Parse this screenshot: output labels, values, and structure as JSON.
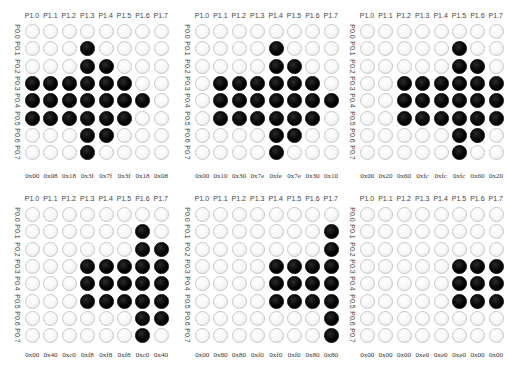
{
  "caption": "",
  "column_labels": [
    "P1.0",
    "P1.1",
    "P1.2",
    "P1.3",
    "P1.4",
    "P1.5",
    "P1.6",
    "P1.7"
  ],
  "row_labels": [
    "P0.0",
    "P0.1",
    "P0.2",
    "P0.3",
    "P0.4",
    "P0.5",
    "P0.6",
    "P0.7"
  ],
  "colors": {
    "led_on": "#000000",
    "led_off": "#f5f5f5",
    "led_border": "#c8c8c8"
  },
  "panels": [
    {
      "id": 1,
      "hex": [
        "0x00",
        "0x08",
        "0x18",
        "0x3f",
        "0x7f",
        "0x3f",
        "0x18",
        "0x08"
      ],
      "grid": [
        [
          0,
          0,
          0,
          0,
          0,
          0,
          0,
          0
        ],
        [
          0,
          0,
          0,
          1,
          0,
          0,
          0,
          0
        ],
        [
          0,
          0,
          0,
          1,
          1,
          0,
          0,
          0
        ],
        [
          1,
          1,
          1,
          1,
          1,
          1,
          0,
          0
        ],
        [
          1,
          1,
          1,
          1,
          1,
          1,
          1,
          0
        ],
        [
          1,
          1,
          1,
          1,
          1,
          1,
          0,
          0
        ],
        [
          0,
          0,
          0,
          1,
          1,
          0,
          0,
          0
        ],
        [
          0,
          0,
          0,
          1,
          0,
          0,
          0,
          0
        ]
      ]
    },
    {
      "id": 2,
      "hex": [
        "0x00",
        "0x10",
        "0x30",
        "0x7e",
        "0xfe",
        "0x7e",
        "0x30",
        "0x10"
      ],
      "grid": [
        [
          0,
          0,
          0,
          0,
          0,
          0,
          0,
          0
        ],
        [
          0,
          0,
          0,
          0,
          1,
          0,
          0,
          0
        ],
        [
          0,
          0,
          0,
          0,
          1,
          1,
          0,
          0
        ],
        [
          0,
          1,
          1,
          1,
          1,
          1,
          1,
          0
        ],
        [
          0,
          1,
          1,
          1,
          1,
          1,
          1,
          1
        ],
        [
          0,
          1,
          1,
          1,
          1,
          1,
          1,
          0
        ],
        [
          0,
          0,
          0,
          0,
          1,
          1,
          0,
          0
        ],
        [
          0,
          0,
          0,
          0,
          1,
          0,
          0,
          0
        ]
      ]
    },
    {
      "id": 3,
      "hex": [
        "0x00",
        "0x20",
        "0x60",
        "0xfc",
        "0xfc",
        "0xfc",
        "0x60",
        "0x20"
      ],
      "grid": [
        [
          0,
          0,
          0,
          0,
          0,
          0,
          0,
          0
        ],
        [
          0,
          0,
          0,
          0,
          0,
          1,
          0,
          0
        ],
        [
          0,
          0,
          0,
          0,
          0,
          1,
          1,
          0
        ],
        [
          0,
          0,
          1,
          1,
          1,
          1,
          1,
          1
        ],
        [
          0,
          0,
          1,
          1,
          1,
          1,
          1,
          1
        ],
        [
          0,
          0,
          1,
          1,
          1,
          1,
          1,
          1
        ],
        [
          0,
          0,
          0,
          0,
          0,
          1,
          1,
          0
        ],
        [
          0,
          0,
          0,
          0,
          0,
          1,
          0,
          0
        ]
      ]
    },
    {
      "id": 4,
      "hex": [
        "0x00",
        "0x40",
        "0xc0",
        "0xf8",
        "0xf8",
        "0xf8",
        "0xc0",
        "0x40"
      ],
      "grid": [
        [
          0,
          0,
          0,
          0,
          0,
          0,
          0,
          0
        ],
        [
          0,
          0,
          0,
          0,
          0,
          0,
          1,
          0
        ],
        [
          0,
          0,
          0,
          0,
          0,
          0,
          1,
          1
        ],
        [
          0,
          0,
          0,
          1,
          1,
          1,
          1,
          1
        ],
        [
          0,
          0,
          0,
          1,
          1,
          1,
          1,
          1
        ],
        [
          0,
          0,
          0,
          1,
          1,
          1,
          1,
          1
        ],
        [
          0,
          0,
          0,
          0,
          0,
          0,
          1,
          1
        ],
        [
          0,
          0,
          0,
          0,
          0,
          0,
          1,
          0
        ]
      ]
    },
    {
      "id": 5,
      "hex": [
        "0x00",
        "0x80",
        "0x80",
        "0xf0",
        "0xf0",
        "0xf0",
        "0x80",
        "0x80"
      ],
      "grid": [
        [
          0,
          0,
          0,
          0,
          0,
          0,
          0,
          0
        ],
        [
          0,
          0,
          0,
          0,
          0,
          0,
          0,
          1
        ],
        [
          0,
          0,
          0,
          0,
          0,
          0,
          0,
          1
        ],
        [
          0,
          0,
          0,
          0,
          1,
          1,
          1,
          1
        ],
        [
          0,
          0,
          0,
          0,
          1,
          1,
          1,
          1
        ],
        [
          0,
          0,
          0,
          0,
          1,
          1,
          1,
          1
        ],
        [
          0,
          0,
          0,
          0,
          0,
          0,
          0,
          1
        ],
        [
          0,
          0,
          0,
          0,
          0,
          0,
          0,
          1
        ]
      ]
    },
    {
      "id": 6,
      "hex": [
        "0x00",
        "0x00",
        "0x00",
        "0xe0",
        "0xe0",
        "0xe0",
        "0x00",
        "0x00"
      ],
      "grid": [
        [
          0,
          0,
          0,
          0,
          0,
          0,
          0,
          0
        ],
        [
          0,
          0,
          0,
          0,
          0,
          0,
          0,
          0
        ],
        [
          0,
          0,
          0,
          0,
          0,
          0,
          0,
          0
        ],
        [
          0,
          0,
          0,
          0,
          0,
          1,
          1,
          1
        ],
        [
          0,
          0,
          0,
          0,
          0,
          1,
          1,
          1
        ],
        [
          0,
          0,
          0,
          0,
          0,
          1,
          1,
          1
        ],
        [
          0,
          0,
          0,
          0,
          0,
          0,
          0,
          0
        ],
        [
          0,
          0,
          0,
          0,
          0,
          0,
          0,
          0
        ]
      ]
    }
  ]
}
